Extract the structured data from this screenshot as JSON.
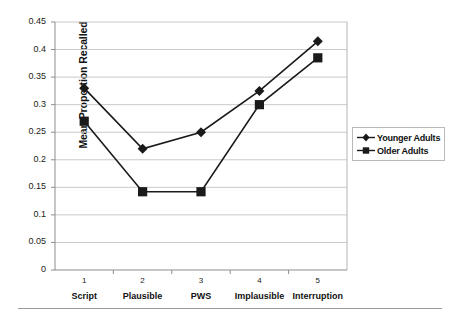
{
  "chart_data": {
    "type": "line",
    "title": "",
    "xlabel": "",
    "ylabel": "Mean Proportion Recalled",
    "ylim": [
      0,
      0.45
    ],
    "ytick_labels": [
      "0",
      "0.05",
      "0.1",
      "0.15",
      "0.2",
      "0.25",
      "0.3",
      "0.35",
      "0.4",
      "0.45"
    ],
    "ytick_values": [
      0,
      0.05,
      0.1,
      0.15,
      0.2,
      0.25,
      0.3,
      0.35,
      0.4,
      0.45
    ],
    "x": [
      1,
      2,
      3,
      4,
      5
    ],
    "xtick_labels": [
      "1",
      "2",
      "3",
      "4",
      "5"
    ],
    "categories": [
      "Script",
      "Plausible",
      "PWS",
      "Implausible",
      "Interruption"
    ],
    "grid": "horizontal",
    "legend_position": "right",
    "series": [
      {
        "name": "Younger Adults",
        "marker": "diamond",
        "color": "#1a1a1a",
        "values": [
          0.33,
          0.22,
          0.25,
          0.325,
          0.415
        ]
      },
      {
        "name": "Older Adults",
        "marker": "square",
        "color": "#1a1a1a",
        "values": [
          0.27,
          0.142,
          0.142,
          0.3,
          0.385
        ]
      }
    ]
  },
  "legend": {
    "items": [
      {
        "label": "Younger Adults",
        "marker": "diamond-marker-icon"
      },
      {
        "label": "Older Adults",
        "marker": "square-marker-icon"
      }
    ]
  },
  "colors": {
    "series": "#1a1a1a",
    "gridline": "#c9c9c9",
    "axis": "#8d8d8d",
    "text": "#1a1a1a"
  }
}
